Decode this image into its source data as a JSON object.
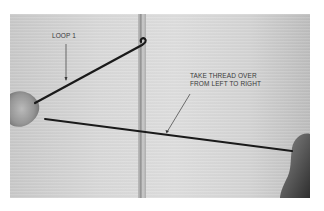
{
  "figure": {
    "annotations": [
      {
        "id": "loop-1",
        "lines": [
          "LOOP 1"
        ]
      },
      {
        "id": "take-thread",
        "lines": [
          "TAKE THREAD OVER",
          "FROM LEFT TO RIGHT"
        ]
      }
    ]
  },
  "colors": {
    "background": "#ffffff",
    "surface": "#d6d6d6",
    "thread": "#1a1a1a",
    "label_text": "#3a3a3a",
    "needle": "#a8a8a8"
  }
}
